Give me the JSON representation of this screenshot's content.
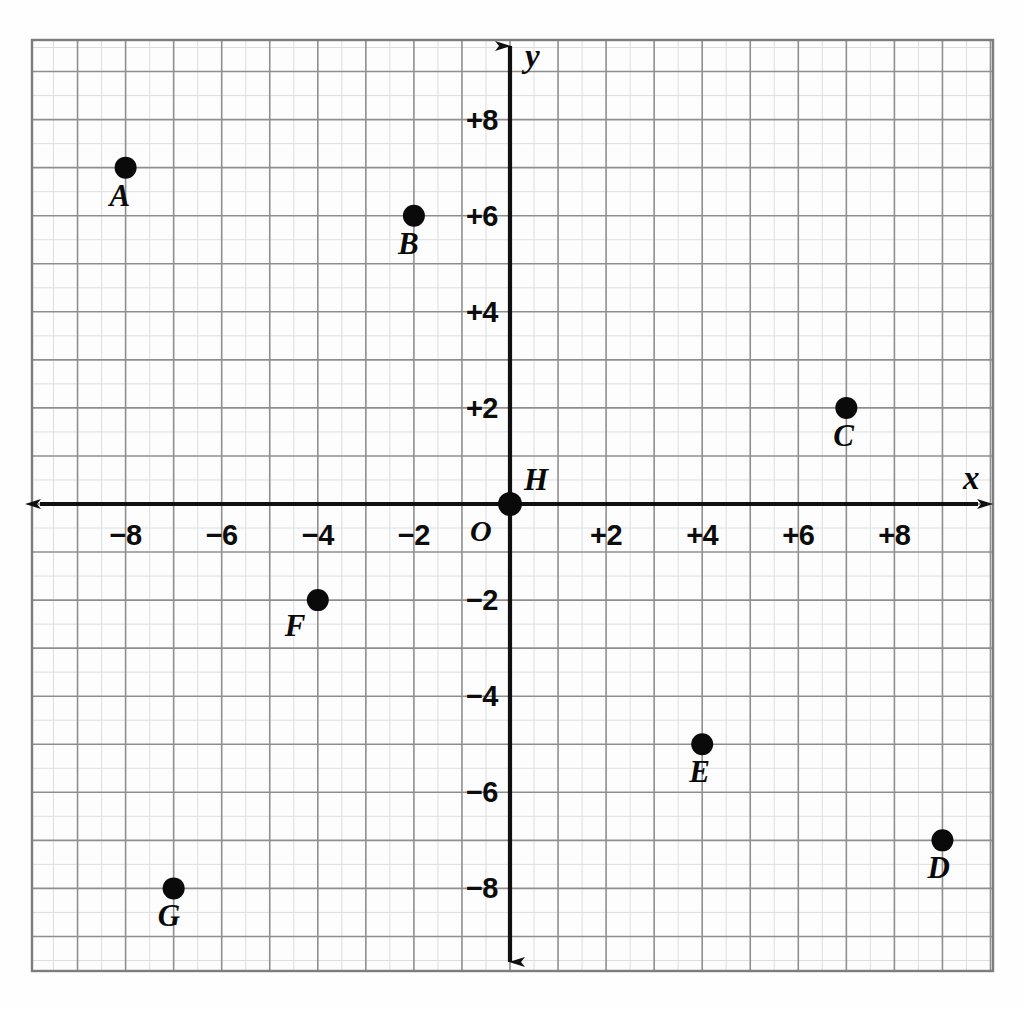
{
  "figure": {
    "kind": "coordinate-plane",
    "background_color": "#fefefe",
    "grid_color": "#8a8a8a",
    "minor_grid_color": "#d8d8d8",
    "axis_color": "#101010",
    "point_color": "#0a0a0a",
    "origin_label": "O",
    "x_axis_name": "x",
    "y_axis_name": "y"
  },
  "chart_data": {
    "type": "scatter",
    "title": "",
    "xlabel": "x",
    "ylabel": "y",
    "xlim": [
      -10,
      10
    ],
    "ylim": [
      -10,
      10
    ],
    "grid": true,
    "grid_step": 1,
    "tick_step": 2,
    "legend": "none",
    "x_tick_labels": [
      "−8",
      "−6",
      "−4",
      "−2",
      "O",
      "+2",
      "+4",
      "+6",
      "+8"
    ],
    "x_tick_values": [
      -8,
      -6,
      -4,
      -2,
      0,
      2,
      4,
      6,
      8
    ],
    "y_tick_labels": [
      "+8",
      "+6",
      "+4",
      "+2",
      "−2",
      "−4",
      "−6",
      "−8"
    ],
    "y_tick_values": [
      8,
      6,
      4,
      2,
      -2,
      -4,
      -6,
      -8
    ],
    "points": [
      {
        "label": "A",
        "x": -8,
        "y": 7,
        "label_dx": -16,
        "label_dy": 12
      },
      {
        "label": "B",
        "x": -2,
        "y": 6,
        "label_dx": -16,
        "label_dy": 12
      },
      {
        "label": "C",
        "x": 7,
        "y": 2,
        "label_dx": -13,
        "label_dy": 12
      },
      {
        "label": "D",
        "x": 9,
        "y": -7,
        "label_dx": -15,
        "label_dy": 12
      },
      {
        "label": "E",
        "x": 4,
        "y": -5,
        "label_dx": -13,
        "label_dy": 12
      },
      {
        "label": "F",
        "x": -4,
        "y": -2,
        "label_dx": -33,
        "label_dy": 10
      },
      {
        "label": "G",
        "x": -7,
        "y": -8,
        "label_dx": -16,
        "label_dy": 12
      },
      {
        "label": "H",
        "x": 0,
        "y": 0,
        "label_dx": 14,
        "label_dy": -40
      }
    ]
  }
}
